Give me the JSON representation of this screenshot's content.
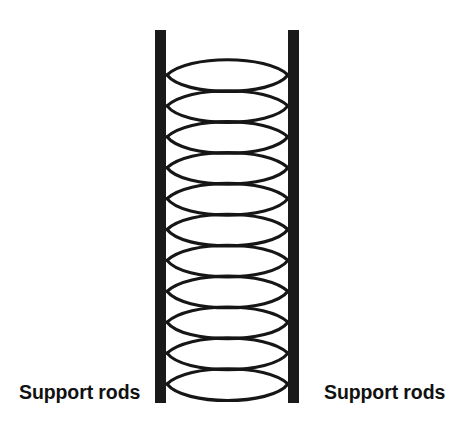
{
  "figure": {
    "background_color": "#ffffff",
    "ink_color": "#161616",
    "width": 473,
    "height": 426
  },
  "labels": {
    "left": "Support rods",
    "right": "Support rods"
  },
  "support_rods": {
    "count": 2,
    "color": "#1a1a1a",
    "left_rod": {
      "x": 155,
      "y": 30,
      "width": 11,
      "height": 373
    },
    "right_rod": {
      "x": 288,
      "y": 30,
      "width": 11,
      "height": 373
    }
  },
  "coil_spring": {
    "turns": 11,
    "stroke_color": "#161616",
    "stroke_width": 3.1,
    "left_x": 167,
    "right_x": 288,
    "top_y": 53,
    "bottom_y": 393,
    "turn_pitch": 30.9,
    "ellipse_height": 44
  }
}
